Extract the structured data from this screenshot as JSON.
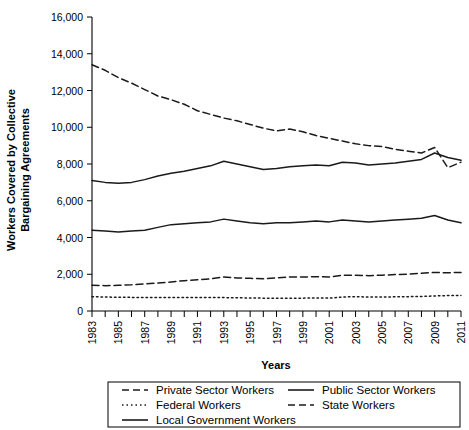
{
  "chart_data": {
    "type": "line",
    "title": "",
    "xlabel": "Years",
    "ylabel": "Workers Covered by Collective Bargaining Agreements",
    "ylabel_line1": "Workers Covered by Collective",
    "ylabel_line2": "Bargaining Agreements",
    "ylim": [
      0,
      16000
    ],
    "ytick_values": [
      0,
      2000,
      4000,
      6000,
      8000,
      10000,
      12000,
      14000,
      16000
    ],
    "ytick_labels": [
      "0",
      "2,000",
      "4,000",
      "6,000",
      "8,000",
      "10,000",
      "12,000",
      "14,000",
      "16,000"
    ],
    "xlim": [
      1983,
      2011
    ],
    "x": [
      1983,
      1984,
      1985,
      1986,
      1987,
      1988,
      1989,
      1990,
      1991,
      1992,
      1993,
      1994,
      1995,
      1996,
      1997,
      1998,
      1999,
      2000,
      2001,
      2002,
      2003,
      2004,
      2005,
      2006,
      2007,
      2008,
      2009,
      2010,
      2011
    ],
    "xtick_values": [
      1983,
      1984,
      1985,
      1986,
      1987,
      1988,
      1989,
      1990,
      1991,
      1992,
      1993,
      1994,
      1995,
      1996,
      1997,
      1998,
      1999,
      2000,
      2001,
      2002,
      2003,
      2004,
      2005,
      2006,
      2007,
      2008,
      2009,
      2010,
      2011
    ],
    "xtick_labels": [
      "1983",
      "",
      "1985",
      "",
      "1987",
      "",
      "1989",
      "",
      "1991",
      "",
      "1993",
      "",
      "1995",
      "",
      "1997",
      "",
      "1999",
      "",
      "2001",
      "",
      "2003",
      "",
      "2005",
      "",
      "2007",
      "",
      "2009",
      "",
      "2011"
    ],
    "grid": false,
    "legend_position": "below",
    "series": [
      {
        "name": "Private Sector Workers",
        "style": "dashed",
        "dasharray": "7,4",
        "values": [
          13400,
          13100,
          12700,
          12400,
          12050,
          11700,
          11500,
          11250,
          10900,
          10700,
          10500,
          10350,
          10150,
          9950,
          9800,
          9900,
          9750,
          9550,
          9400,
          9250,
          9100,
          9000,
          8950,
          8800,
          8700,
          8600,
          8900,
          7800,
          8100
        ]
      },
      {
        "name": "Public Sector Workers",
        "style": "solid",
        "dasharray": "",
        "values": [
          7100,
          7000,
          6950,
          7000,
          7150,
          7350,
          7500,
          7600,
          7750,
          7900,
          8150,
          8000,
          7850,
          7700,
          7750,
          7850,
          7900,
          7950,
          7900,
          8100,
          8050,
          7950,
          8000,
          8050,
          8150,
          8250,
          8600,
          8350,
          8200
        ]
      },
      {
        "name": "Local Government Workers",
        "style": "solid",
        "dasharray": "",
        "values": [
          4400,
          4350,
          4300,
          4350,
          4400,
          4550,
          4700,
          4750,
          4800,
          4850,
          5000,
          4900,
          4800,
          4750,
          4800,
          4800,
          4850,
          4900,
          4850,
          4950,
          4900,
          4850,
          4900,
          4950,
          5000,
          5050,
          5200,
          4950,
          4800
        ]
      },
      {
        "name": "State Workers",
        "style": "dashed",
        "dasharray": "7,4",
        "values": [
          1400,
          1380,
          1400,
          1430,
          1480,
          1520,
          1580,
          1650,
          1700,
          1750,
          1850,
          1800,
          1780,
          1750,
          1800,
          1850,
          1850,
          1870,
          1850,
          1950,
          1950,
          1920,
          1950,
          1980,
          2000,
          2050,
          2100,
          2080,
          2100
        ]
      },
      {
        "name": "Federal Workers",
        "style": "dotted",
        "dasharray": "1.5,3",
        "values": [
          780,
          760,
          750,
          740,
          740,
          740,
          740,
          740,
          740,
          730,
          730,
          720,
          710,
          700,
          700,
          700,
          700,
          710,
          700,
          760,
          780,
          760,
          760,
          770,
          780,
          790,
          820,
          840,
          850
        ]
      }
    ]
  },
  "legend": {
    "entries": [
      {
        "label": "Private Sector Workers",
        "style": "dashed"
      },
      {
        "label": "Public Sector Workers",
        "style": "solid"
      },
      {
        "label": "Federal Workers",
        "style": "dotted"
      },
      {
        "label": "State Workers",
        "style": "dashed"
      },
      {
        "label": "Local Government Workers",
        "style": "solid"
      }
    ]
  },
  "colors": {
    "line": "#1a1a1a",
    "axis": "#000000",
    "background": "#ffffff"
  }
}
